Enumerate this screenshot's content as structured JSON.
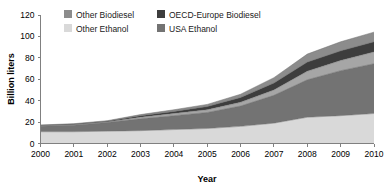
{
  "chart_data": {
    "type": "area",
    "stacked": true,
    "title": "",
    "subtitle": "",
    "xlabel": "Year",
    "ylabel": "Billion liters",
    "x": [
      2000,
      2001,
      2002,
      2003,
      2004,
      2005,
      2006,
      2007,
      2008,
      2009,
      2010
    ],
    "categories": [
      "2000",
      "2001",
      "2002",
      "2003",
      "2004",
      "2005",
      "2006",
      "2007",
      "2008",
      "2009",
      "2010"
    ],
    "xtick_labels": [
      "2000",
      "2001",
      "2002",
      "2003",
      "2004",
      "2005",
      "2006",
      "2007",
      "2008",
      "2009",
      "2010"
    ],
    "ytick_labels": [
      "0",
      "20",
      "40",
      "60",
      "80",
      "100",
      "120"
    ],
    "ytick_values": [
      0,
      20,
      40,
      60,
      80,
      100,
      120
    ],
    "ylim": [
      0,
      120
    ],
    "xlim": [
      2000,
      2010
    ],
    "grid": false,
    "legend_position": "top-inside",
    "series": [
      {
        "name": "Other Ethanol",
        "color": "#d9d9d9",
        "stack_order": 1,
        "values": [
          11.0,
          11.0,
          11.5,
          12.0,
          13.0,
          14.0,
          16.0,
          19.0,
          24.5,
          26.0,
          28.0
        ]
      },
      {
        "name": "USA Ethanol",
        "color": "#737373",
        "stack_order": 2,
        "values": [
          5.0,
          6.0,
          8.0,
          11.0,
          13.0,
          15.0,
          19.0,
          26.0,
          35.0,
          42.0,
          46.5
        ]
      },
      {
        "name": "Other Biodiesel",
        "color": "#a6a6a6",
        "stack_order": 3,
        "values": [
          0.5,
          0.5,
          0.5,
          1.5,
          2.0,
          2.5,
          3.5,
          5.0,
          8.0,
          9.5,
          11.0
        ]
      },
      {
        "name": "OECD-Europe Biodiesel",
        "color": "#3d3d3d",
        "stack_order": 4,
        "values": [
          0.5,
          0.6,
          0.8,
          1.5,
          2.0,
          3.0,
          4.5,
          6.5,
          8.5,
          9.0,
          9.5
        ]
      },
      {
        "name": "Other Biodiesel (top band)",
        "color": "#8c8c8c",
        "stack_order": 5,
        "values": [
          0.3,
          0.4,
          0.5,
          1.0,
          1.5,
          2.0,
          3.0,
          5.0,
          7.5,
          8.5,
          9.0
        ]
      }
    ],
    "totals": [
      17.3,
      18.5,
      21.3,
      27.0,
      31.5,
      36.5,
      46.0,
      61.5,
      83.5,
      95.0,
      104.0
    ]
  },
  "legend": {
    "entries": [
      {
        "label": "Other Biodiesel",
        "color": "#8c8c8c"
      },
      {
        "label": "OECD-Europe Biodiesel",
        "color": "#3d3d3d"
      },
      {
        "label": "Other Ethanol",
        "color": "#d9d9d9"
      },
      {
        "label": "USA Ethanol",
        "color": "#737373"
      }
    ]
  },
  "axes": {
    "y_title": "Billion liters",
    "x_title": "Year",
    "y_ticks": [
      "120",
      "100",
      "80",
      "60",
      "40",
      "20",
      "0"
    ],
    "x_ticks": [
      "2000",
      "2001",
      "2002",
      "2003",
      "2004",
      "2005",
      "2006",
      "2007",
      "2008",
      "2009",
      "2010"
    ]
  },
  "colors": {
    "other_biodiesel": "#8c8c8c",
    "oecd_europe_biodiesel": "#3d3d3d",
    "other_ethanol": "#d9d9d9",
    "usa_ethanol": "#737373",
    "axis": "#808080",
    "text": "#000000",
    "background": "#ffffff"
  }
}
